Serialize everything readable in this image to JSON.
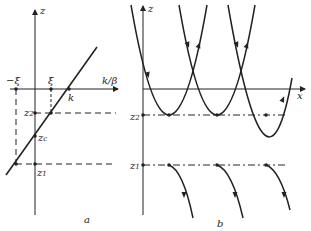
{
  "panel_a": {
    "caption": "a",
    "axis_vertical_label": "z",
    "axis_horizontal_label": "k/β",
    "points": {
      "minus_xi": "−ξ",
      "xi": "ξ",
      "k": "k"
    },
    "levels": {
      "z2": {
        "base": "z",
        "sub": "2"
      },
      "zc": {
        "base": "z",
        "sub": "c"
      },
      "z1": {
        "base": "z",
        "sub": "1"
      }
    }
  },
  "panel_b": {
    "caption": "b",
    "axis_vertical_label": "z",
    "axis_horizontal_label": "x",
    "levels": {
      "z2": {
        "base": "z",
        "sub": "2"
      },
      "z1": {
        "base": "z",
        "sub": "1"
      }
    }
  },
  "colors": {
    "ink": "#222222",
    "background": "#ffffff"
  }
}
